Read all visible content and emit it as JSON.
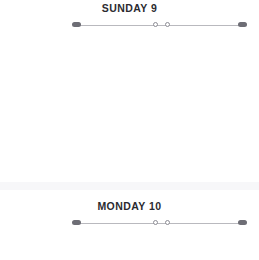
{
  "app": {
    "background_color": "#ffffff",
    "text_color": "#2b2b30",
    "rail_color": "#b9b9be",
    "marker_color": "#6d6d75",
    "divider_color": "#f7f7f9"
  },
  "days": [
    {
      "title": "SUNDAY 9",
      "markers": {
        "start_cap": "start-cap",
        "end_cap": "end-cap",
        "mid_dot_a": "mid-dot-a",
        "mid_dot_b": "mid-dot-b"
      }
    },
    {
      "title": "MONDAY 10",
      "markers": {
        "start_cap": "start-cap",
        "end_cap": "end-cap",
        "mid_dot_a": "mid-dot-a",
        "mid_dot_b": "mid-dot-b"
      }
    }
  ],
  "divider": {
    "label": "section-divider"
  }
}
